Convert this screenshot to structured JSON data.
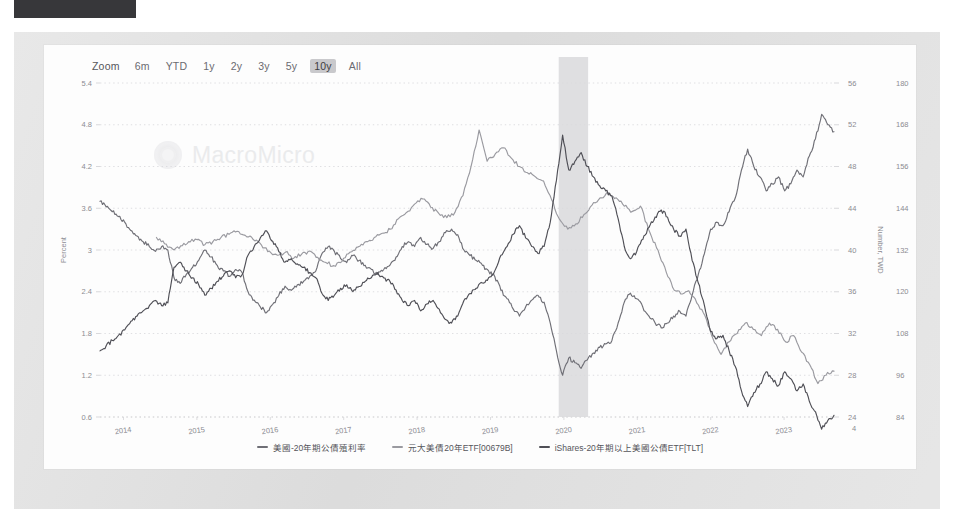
{
  "window": {
    "top_bar_title": ""
  },
  "zoom": {
    "label": "Zoom",
    "options": [
      {
        "label": "6m",
        "active": false
      },
      {
        "label": "YTD",
        "active": false
      },
      {
        "label": "1y",
        "active": false
      },
      {
        "label": "2y",
        "active": false
      },
      {
        "label": "3y",
        "active": false
      },
      {
        "label": "5y",
        "active": false
      },
      {
        "label": "10y",
        "active": true
      },
      {
        "label": "All",
        "active": false
      }
    ]
  },
  "watermark": {
    "text": "MacroMicro",
    "logo_icon": "macromicro-logo-icon"
  },
  "chart_data": {
    "type": "line",
    "title": "",
    "xlabel": "",
    "grid": true,
    "legend_position": "bottom",
    "x_ticks": [
      "2014",
      "2015",
      "2016",
      "2017",
      "2018",
      "2019",
      "2020",
      "2021",
      "2022",
      "2023"
    ],
    "x_range": [
      "2013-10",
      "2023-11"
    ],
    "axes": [
      {
        "id": "left",
        "label": "Percent",
        "ticks": [
          "5.4",
          "4.8",
          "4.2",
          "3.6",
          "3",
          "2.4",
          "1.8",
          "1.2",
          "0.6"
        ],
        "min": 0.6,
        "max": 5.4
      },
      {
        "id": "right1",
        "label": "Number, TWD",
        "ticks": [
          "56",
          "52",
          "48",
          "44",
          "40",
          "36",
          "32",
          "28",
          "24"
        ],
        "min": 24,
        "max": 56
      },
      {
        "id": "right2",
        "label": "Number, USD",
        "ticks": [
          "180",
          "168",
          "156",
          "144",
          "132",
          "120",
          "108",
          "96",
          "84"
        ],
        "min": 84,
        "max": 180
      }
    ],
    "shaded_regions": [
      {
        "name": "covid-crash-band",
        "from": "2020-02",
        "to": "2020-05",
        "color": "#d9d9dc"
      }
    ],
    "series": [
      {
        "name": "美國-20年期公債殖利率",
        "axis": "left",
        "color": "#6f6f76",
        "unit": "Percent",
        "values": [
          3.7,
          3.62,
          3.55,
          3.48,
          3.4,
          3.28,
          3.2,
          3.12,
          3.05,
          2.98,
          3.05,
          3.0,
          2.6,
          2.52,
          2.65,
          2.75,
          2.85,
          3.0,
          2.9,
          2.78,
          2.7,
          2.62,
          2.72,
          2.68,
          2.4,
          2.28,
          2.18,
          2.1,
          2.22,
          2.35,
          2.48,
          2.42,
          2.5,
          2.55,
          2.62,
          2.7,
          2.95,
          3.05,
          2.98,
          2.88,
          2.82,
          2.92,
          2.85,
          2.78,
          2.72,
          2.65,
          2.72,
          2.78,
          2.9,
          3.05,
          3.12,
          3.05,
          3.18,
          3.08,
          3.02,
          3.12,
          3.25,
          3.3,
          3.22,
          3.0,
          2.92,
          2.85,
          2.78,
          2.7,
          2.62,
          2.42,
          2.3,
          2.15,
          2.05,
          2.18,
          2.28,
          2.35,
          2.25,
          1.95,
          1.55,
          1.2,
          1.45,
          1.38,
          1.3,
          1.42,
          1.52,
          1.6,
          1.65,
          1.7,
          1.95,
          2.25,
          2.38,
          2.3,
          2.18,
          2.05,
          1.95,
          1.88,
          1.95,
          2.05,
          2.12,
          2.05,
          2.35,
          2.65,
          2.95,
          3.3,
          3.4,
          3.35,
          3.55,
          3.75,
          4.15,
          4.45,
          4.2,
          4.05,
          3.85,
          3.95,
          4.05,
          3.85,
          3.95,
          4.15,
          4.05,
          4.35,
          4.6,
          4.95,
          4.8,
          4.7
        ]
      },
      {
        "name": "元大美債20年ETF[00679B]",
        "axis": "right1",
        "color": "#9a9aa0",
        "unit": "Number, TWD",
        "values": [
          null,
          null,
          null,
          null,
          null,
          null,
          null,
          null,
          null,
          null,
          null,
          null,
          null,
          null,
          null,
          null,
          null,
          null,
          null,
          null,
          null,
          null,
          null,
          null,
          null,
          null,
          null,
          null,
          null,
          null,
          null,
          null,
          null,
          null,
          null,
          41.2,
          40.6,
          40.1,
          40.4,
          40.8,
          41.0,
          40.5,
          40.8,
          41.2,
          41.5,
          41.8,
          41.4,
          41.0,
          40.5,
          39.9,
          39.5,
          39.8,
          39.2,
          39.6,
          39.9,
          39.3,
          38.8,
          38.5,
          38.9,
          39.8,
          40.3,
          40.8,
          41.2,
          41.6,
          42.0,
          43.0,
          43.6,
          44.4,
          44.9,
          44.1,
          43.5,
          43.1,
          43.6,
          45.2,
          48.0,
          51.5,
          48.5,
          49.2,
          49.8,
          48.8,
          48.0,
          47.4,
          47.0,
          46.6,
          44.8,
          42.9,
          42.0,
          42.5,
          43.4,
          44.3,
          45.0,
          45.5,
          45.0,
          44.2,
          43.7,
          44.2,
          42.0,
          40.2,
          38.4,
          36.4,
          35.8,
          36.1,
          34.9,
          33.7,
          31.5,
          30.0,
          31.2,
          32.0,
          33.0,
          32.4,
          31.8,
          33.0,
          32.4,
          31.2,
          31.8,
          30.2,
          29.0,
          27.2,
          28.0,
          28.4
        ]
      },
      {
        "name": "iShares-20年期以上美國公債ETF[TLT]",
        "axis": "right2",
        "color": "#4f4f56",
        "unit": "Number, USD",
        "values": [
          103.0,
          104.5,
          106.0,
          107.5,
          109.0,
          111.5,
          113.0,
          114.5,
          116.0,
          117.5,
          116.0,
          116.8,
          127.0,
          128.5,
          126.0,
          124.0,
          122.0,
          119.0,
          121.0,
          123.0,
          124.5,
          126.0,
          124.0,
          124.8,
          130.5,
          133.0,
          135.5,
          137.5,
          134.5,
          131.5,
          128.5,
          129.5,
          128.0,
          127.0,
          125.5,
          124.0,
          119.5,
          117.5,
          119.0,
          121.0,
          122.0,
          120.0,
          121.5,
          123.0,
          124.0,
          125.5,
          124.0,
          123.0,
          120.5,
          117.5,
          116.0,
          117.5,
          114.5,
          116.5,
          117.5,
          115.0,
          112.0,
          111.0,
          113.0,
          117.5,
          119.5,
          121.0,
          122.5,
          124.0,
          126.0,
          130.5,
          133.0,
          136.5,
          139.0,
          135.5,
          133.0,
          131.0,
          133.0,
          140.0,
          152.0,
          165.0,
          155.0,
          157.5,
          160.0,
          156.0,
          153.0,
          150.5,
          149.0,
          147.5,
          141.0,
          133.0,
          129.5,
          131.5,
          135.0,
          138.5,
          141.5,
          143.5,
          141.5,
          138.0,
          136.0,
          138.0,
          129.0,
          122.5,
          116.0,
          108.5,
          106.5,
          107.5,
          103.0,
          98.5,
          91.5,
          87.0,
          91.0,
          93.5,
          97.0,
          95.0,
          93.0,
          97.0,
          95.0,
          91.5,
          93.5,
          88.5,
          85.5,
          80.5,
          83.0,
          84.5
        ]
      }
    ]
  },
  "legend": [
    {
      "label": "美國-20年期公債殖利率",
      "color": "#6f6f76"
    },
    {
      "label": "元大美債20年ETF[00679B]",
      "color": "#9a9aa0"
    },
    {
      "label": "iShares-20年期以上美國公債ETF[TLT]",
      "color": "#4f4f56"
    }
  ]
}
